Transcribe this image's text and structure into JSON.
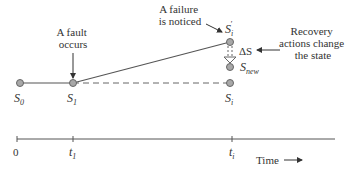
{
  "diagram": {
    "annotations": {
      "fault": [
        "A fault",
        "occurs"
      ],
      "failure": [
        "A failure",
        "is noticed"
      ],
      "recovery": [
        "Recovery",
        "actions change",
        "the state"
      ]
    },
    "states": {
      "s0": {
        "base": "S",
        "sub": "0"
      },
      "s1": {
        "base": "S",
        "sub": "1"
      },
      "si": {
        "base": "S",
        "sub": "i"
      },
      "si_prime": {
        "base": "S",
        "sub": "i",
        "prime": "′"
      },
      "snew": {
        "base": "S",
        "sub": "new"
      }
    },
    "delta_label": "ΔS",
    "time_axis": {
      "ticks": [
        {
          "base": "0",
          "sub": ""
        },
        {
          "base": "t",
          "sub": "1"
        },
        {
          "base": "t",
          "sub": "i"
        }
      ],
      "label": "Time"
    },
    "colors": {
      "line": "#444444",
      "node_fill": "#a8a8a8",
      "node_stroke": "#666666",
      "text": "#333333"
    }
  }
}
